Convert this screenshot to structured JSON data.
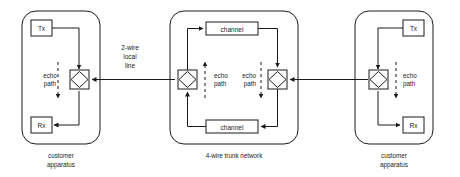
{
  "diagram": {
    "type": "block-diagram",
    "colors": {
      "line": "#1a1a1a",
      "background": "#ffffff",
      "fill": "#ffffff"
    },
    "groups": [
      {
        "id": "left-customer",
        "caption_line1": "customer",
        "caption_line2": "apparatus",
        "nodes": [
          {
            "id": "left-tx",
            "label": "Tx"
          },
          {
            "id": "left-rx",
            "label": "Rx"
          },
          {
            "id": "left-hybrid",
            "label": ""
          }
        ],
        "echo_label_line1": "echo",
        "echo_label_line2": "path"
      },
      {
        "id": "trunk",
        "caption_line1": "4-wire trunk network",
        "caption_line2": "",
        "nodes": [
          {
            "id": "channel-top",
            "label": "channel"
          },
          {
            "id": "channel-bottom",
            "label": "channel"
          },
          {
            "id": "trunk-hybrid-left",
            "label": ""
          },
          {
            "id": "trunk-hybrid-right",
            "label": ""
          }
        ],
        "echo_left_line1": "echo",
        "echo_left_line2": "path",
        "echo_right_line1": "echo",
        "echo_right_line2": "path"
      },
      {
        "id": "right-customer",
        "caption_line1": "customer",
        "caption_line2": "apparatus",
        "nodes": [
          {
            "id": "right-tx",
            "label": "Tx"
          },
          {
            "id": "right-rx",
            "label": "Rx"
          },
          {
            "id": "right-hybrid",
            "label": ""
          }
        ],
        "echo_label_line1": "echo",
        "echo_label_line2": "path"
      }
    ],
    "connectors": [
      {
        "id": "local-line-left",
        "label_line1": "2-wire",
        "label_line2": "local",
        "label_line3": "line"
      }
    ]
  }
}
